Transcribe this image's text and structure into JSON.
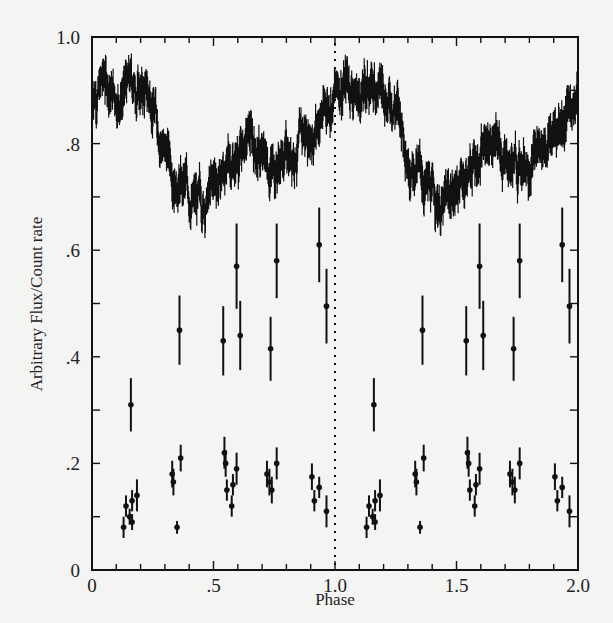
{
  "chart_data": {
    "type": "scatter",
    "title": "",
    "xlabel": "Phase",
    "ylabel": "Arbitrary Flux/Count rate",
    "xlim": [
      0,
      2.0
    ],
    "ylim": [
      0,
      1.0
    ],
    "x_ticks": [
      {
        "value": 0,
        "label": "0"
      },
      {
        "value": 0.5,
        "label": ".5"
      },
      {
        "value": 1.0,
        "label": "1.0"
      },
      {
        "value": 1.5,
        "label": "1.5"
      },
      {
        "value": 2.0,
        "label": "2.0"
      }
    ],
    "y_ticks": [
      {
        "value": 0,
        "label": "0"
      },
      {
        "value": 0.2,
        "label": ".2"
      },
      {
        "value": 0.4,
        "label": ".4"
      },
      {
        "value": 0.6,
        "label": ".6"
      },
      {
        "value": 0.8,
        "label": ".8"
      },
      {
        "value": 1.0,
        "label": "1.0"
      }
    ],
    "minor_x_step": 0.1,
    "minor_y_step": 0.1,
    "grid": false,
    "legend": null,
    "annotations": [
      {
        "type": "vertical-dotted-line",
        "x": 1.0
      }
    ],
    "series": [
      {
        "name": "optical light curve (noisy continuous)",
        "type": "line",
        "x": [
          0.0,
          0.05,
          0.1,
          0.15,
          0.2,
          0.25,
          0.3,
          0.35,
          0.4,
          0.45,
          0.5,
          0.55,
          0.6,
          0.65,
          0.7,
          0.75,
          0.8,
          0.85,
          0.9,
          0.95,
          1.0,
          1.05,
          1.1,
          1.15,
          1.2,
          1.25,
          1.3,
          1.35,
          1.4,
          1.45,
          1.5,
          1.55,
          1.6,
          1.65,
          1.7,
          1.75,
          1.8,
          1.85,
          1.9,
          1.95,
          2.0
        ],
        "y": [
          0.9,
          0.92,
          0.89,
          0.91,
          0.9,
          0.88,
          0.79,
          0.74,
          0.7,
          0.68,
          0.72,
          0.75,
          0.78,
          0.81,
          0.77,
          0.76,
          0.78,
          0.8,
          0.82,
          0.86,
          0.9,
          0.92,
          0.89,
          0.91,
          0.9,
          0.88,
          0.79,
          0.74,
          0.7,
          0.68,
          0.72,
          0.75,
          0.78,
          0.81,
          0.77,
          0.76,
          0.78,
          0.8,
          0.82,
          0.86,
          0.9
        ],
        "noise_amplitude": 0.03
      },
      {
        "name": "count rate points with error bars",
        "type": "errorbar",
        "points": [
          {
            "x": 0.13,
            "y": 0.08,
            "err": 0.02
          },
          {
            "x": 0.14,
            "y": 0.12,
            "err": 0.02
          },
          {
            "x": 0.155,
            "y": 0.1,
            "err": 0.015
          },
          {
            "x": 0.165,
            "y": 0.09,
            "err": 0.015
          },
          {
            "x": 0.165,
            "y": 0.13,
            "err": 0.02
          },
          {
            "x": 0.185,
            "y": 0.14,
            "err": 0.03
          },
          {
            "x": 0.16,
            "y": 0.31,
            "err": 0.05
          },
          {
            "x": 0.33,
            "y": 0.18,
            "err": 0.025
          },
          {
            "x": 0.335,
            "y": 0.165,
            "err": 0.025
          },
          {
            "x": 0.35,
            "y": 0.08,
            "err": 0.012
          },
          {
            "x": 0.365,
            "y": 0.21,
            "err": 0.025
          },
          {
            "x": 0.36,
            "y": 0.45,
            "err": 0.065
          },
          {
            "x": 0.545,
            "y": 0.22,
            "err": 0.03
          },
          {
            "x": 0.55,
            "y": 0.2,
            "err": 0.025
          },
          {
            "x": 0.555,
            "y": 0.15,
            "err": 0.02
          },
          {
            "x": 0.575,
            "y": 0.12,
            "err": 0.02
          },
          {
            "x": 0.58,
            "y": 0.16,
            "err": 0.02
          },
          {
            "x": 0.595,
            "y": 0.19,
            "err": 0.03
          },
          {
            "x": 0.54,
            "y": 0.43,
            "err": 0.065
          },
          {
            "x": 0.595,
            "y": 0.57,
            "err": 0.08
          },
          {
            "x": 0.61,
            "y": 0.44,
            "err": 0.065
          },
          {
            "x": 0.72,
            "y": 0.18,
            "err": 0.025
          },
          {
            "x": 0.73,
            "y": 0.165,
            "err": 0.025
          },
          {
            "x": 0.74,
            "y": 0.15,
            "err": 0.025
          },
          {
            "x": 0.76,
            "y": 0.2,
            "err": 0.03
          },
          {
            "x": 0.735,
            "y": 0.415,
            "err": 0.06
          },
          {
            "x": 0.76,
            "y": 0.58,
            "err": 0.07
          },
          {
            "x": 0.905,
            "y": 0.175,
            "err": 0.025
          },
          {
            "x": 0.915,
            "y": 0.13,
            "err": 0.02
          },
          {
            "x": 0.935,
            "y": 0.155,
            "err": 0.02
          },
          {
            "x": 0.965,
            "y": 0.11,
            "err": 0.03
          },
          {
            "x": 0.935,
            "y": 0.61,
            "err": 0.07
          },
          {
            "x": 0.965,
            "y": 0.495,
            "err": 0.07
          },
          {
            "x": 1.13,
            "y": 0.08,
            "err": 0.02
          },
          {
            "x": 1.14,
            "y": 0.12,
            "err": 0.02
          },
          {
            "x": 1.155,
            "y": 0.1,
            "err": 0.015
          },
          {
            "x": 1.165,
            "y": 0.09,
            "err": 0.015
          },
          {
            "x": 1.165,
            "y": 0.13,
            "err": 0.02
          },
          {
            "x": 1.185,
            "y": 0.14,
            "err": 0.03
          },
          {
            "x": 1.16,
            "y": 0.31,
            "err": 0.05
          },
          {
            "x": 1.33,
            "y": 0.18,
            "err": 0.025
          },
          {
            "x": 1.335,
            "y": 0.165,
            "err": 0.025
          },
          {
            "x": 1.35,
            "y": 0.08,
            "err": 0.012
          },
          {
            "x": 1.365,
            "y": 0.21,
            "err": 0.025
          },
          {
            "x": 1.36,
            "y": 0.45,
            "err": 0.065
          },
          {
            "x": 1.545,
            "y": 0.22,
            "err": 0.03
          },
          {
            "x": 1.55,
            "y": 0.2,
            "err": 0.025
          },
          {
            "x": 1.555,
            "y": 0.15,
            "err": 0.02
          },
          {
            "x": 1.575,
            "y": 0.12,
            "err": 0.02
          },
          {
            "x": 1.58,
            "y": 0.16,
            "err": 0.02
          },
          {
            "x": 1.595,
            "y": 0.19,
            "err": 0.03
          },
          {
            "x": 1.54,
            "y": 0.43,
            "err": 0.065
          },
          {
            "x": 1.595,
            "y": 0.57,
            "err": 0.08
          },
          {
            "x": 1.61,
            "y": 0.44,
            "err": 0.065
          },
          {
            "x": 1.72,
            "y": 0.18,
            "err": 0.025
          },
          {
            "x": 1.73,
            "y": 0.165,
            "err": 0.025
          },
          {
            "x": 1.74,
            "y": 0.15,
            "err": 0.025
          },
          {
            "x": 1.76,
            "y": 0.2,
            "err": 0.03
          },
          {
            "x": 1.735,
            "y": 0.415,
            "err": 0.06
          },
          {
            "x": 1.76,
            "y": 0.58,
            "err": 0.07
          },
          {
            "x": 1.905,
            "y": 0.175,
            "err": 0.025
          },
          {
            "x": 1.915,
            "y": 0.13,
            "err": 0.02
          },
          {
            "x": 1.935,
            "y": 0.155,
            "err": 0.02
          },
          {
            "x": 1.965,
            "y": 0.11,
            "err": 0.03
          },
          {
            "x": 1.935,
            "y": 0.61,
            "err": 0.07
          },
          {
            "x": 1.965,
            "y": 0.495,
            "err": 0.07
          }
        ]
      }
    ]
  },
  "layout": {
    "ink_color": "#111111",
    "paper_color": "#f4f4f2"
  }
}
